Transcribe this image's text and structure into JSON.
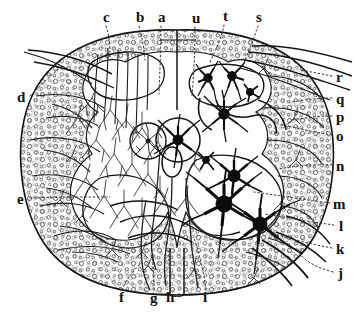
{
  "figure": {
    "kind": "histological-illustration",
    "stain_style": "golgi-silver-impregnation",
    "background_color": "#ffffff",
    "ink_color": "#111111",
    "stipple_color": "#4a4a4a",
    "leader_line_style": "dotted"
  },
  "labels": {
    "top": [
      {
        "key": "c",
        "text": "c",
        "x": 103,
        "y": 10
      },
      {
        "key": "b",
        "text": "b",
        "x": 136,
        "y": 10
      },
      {
        "key": "a",
        "text": "a",
        "x": 158,
        "y": 10
      },
      {
        "key": "u",
        "text": "u",
        "x": 192,
        "y": 11
      },
      {
        "key": "t",
        "text": "t",
        "x": 223,
        "y": 9
      },
      {
        "key": "s",
        "text": "s",
        "x": 256,
        "y": 10
      }
    ],
    "right": [
      {
        "key": "r",
        "text": "r",
        "x": 336,
        "y": 78
      },
      {
        "key": "q",
        "text": "q",
        "x": 336,
        "y": 100
      },
      {
        "key": "p",
        "text": "p",
        "x": 336,
        "y": 118
      },
      {
        "key": "o",
        "text": "o",
        "x": 336,
        "y": 137
      },
      {
        "key": "n",
        "text": "n",
        "x": 336,
        "y": 167
      },
      {
        "key": "m",
        "text": "m",
        "x": 334,
        "y": 205
      },
      {
        "key": "l",
        "text": "l",
        "x": 338,
        "y": 227
      },
      {
        "key": "k",
        "text": "k",
        "x": 336,
        "y": 250
      },
      {
        "key": "j",
        "text": "j",
        "x": 337,
        "y": 274
      }
    ],
    "left": [
      {
        "key": "d",
        "text": "d",
        "x": 18,
        "y": 98
      },
      {
        "key": "e",
        "text": "e",
        "x": 18,
        "y": 200
      }
    ],
    "bottom": [
      {
        "key": "f",
        "text": "f",
        "x": 119,
        "y": 296
      },
      {
        "key": "g",
        "text": "g",
        "x": 152,
        "y": 297
      },
      {
        "key": "h",
        "text": "h",
        "x": 168,
        "y": 296
      },
      {
        "key": "i",
        "text": "i",
        "x": 204,
        "y": 296
      }
    ]
  },
  "anatomy": {
    "outline_name": "cord-outline",
    "gray_matter_name": "gray-matter-butterfly",
    "central_canal_name": "central-canal",
    "ventral_fissure_name": "ventral-median-fissure",
    "dorsal_septum_name": "dorsal-median-septum",
    "dorsal_root_name": "dorsal-root-fibers",
    "ventral_root_name": "ventral-root-fibers"
  },
  "neurons": {
    "dark_cells_count": 11,
    "fine_arbor_side": "left",
    "dark_arbor_side": "right"
  }
}
